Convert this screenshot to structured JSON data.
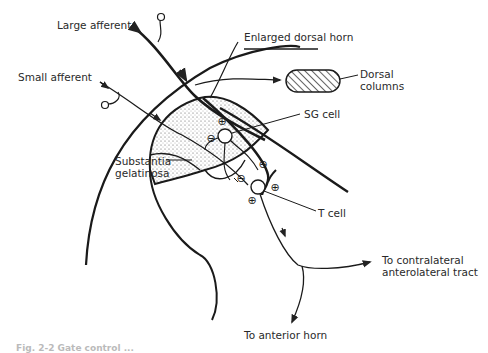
{
  "diagram": {
    "type": "neuroanatomy-schematic",
    "labels": {
      "large_afferent": "Large afferent",
      "small_afferent": "Small afferent",
      "enlarged_dorsal_horn": "Enlarged dorsal horn",
      "dorsal_columns": "Dorsal\ncolumns",
      "sg_cell": "SG cell",
      "substantia_gelatinosa": "Substantia\ngelatinosa",
      "t_cell": "T cell",
      "to_contralateral": "To contralateral\nanterolateral tract",
      "to_anterior_horn": "To anterior horn"
    },
    "synapse_signs": {
      "excitatory": "⊕",
      "inhibitory": "⊖"
    },
    "caption": "Fig. 2-2  Gate control ..."
  }
}
